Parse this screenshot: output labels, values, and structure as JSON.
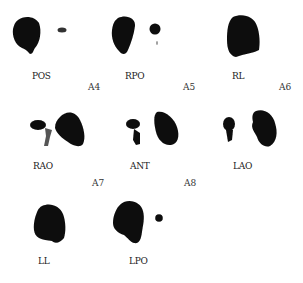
{
  "figure": {
    "views": [
      {
        "label": "POS",
        "panel": "A4"
      },
      {
        "label": "RPO",
        "panel": "A5"
      },
      {
        "label": "RL",
        "panel": "A6"
      },
      {
        "label": "RAO",
        "panel": "A7"
      },
      {
        "label": "ANT",
        "panel": "A8"
      },
      {
        "label": "LAO",
        "panel": ""
      },
      {
        "label": "LL",
        "panel": ""
      },
      {
        "label": "LPO",
        "panel": ""
      }
    ],
    "colors": {
      "uptake": "#0b0b0b",
      "background": "#ffffff"
    }
  }
}
